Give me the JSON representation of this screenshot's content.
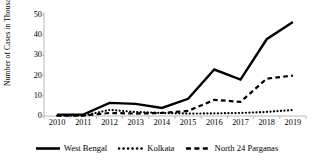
{
  "chart_data": {
    "type": "line",
    "title": "",
    "xlabel": "",
    "ylabel": "Number of Cases in Thousand",
    "categories": [
      "2010",
      "2011",
      "2012",
      "2013",
      "2014",
      "2015",
      "2016",
      "2017",
      "2018",
      "2019"
    ],
    "ylim": [
      0,
      50
    ],
    "yticks": [
      0,
      10,
      20,
      30,
      40,
      50
    ],
    "grid": false,
    "legend_position": "bottom",
    "series": [
      {
        "name": "West Bengal",
        "style": "solid",
        "color": "#000000",
        "values": [
          0.7,
          0.7,
          6.5,
          6.0,
          4.0,
          8.5,
          23.0,
          18.0,
          38.0,
          46.5
        ]
      },
      {
        "name": "Kolkata",
        "style": "dotted",
        "color": "#000000",
        "values": [
          0.2,
          0.2,
          3.0,
          2.0,
          1.5,
          1.2,
          1.3,
          1.5,
          2.0,
          3.0
        ]
      },
      {
        "name": "North 24 Parganas",
        "style": "dashed",
        "color": "#000000",
        "values": [
          0.2,
          0.2,
          1.5,
          1.2,
          1.5,
          2.5,
          8.0,
          7.0,
          18.5,
          20.0
        ]
      }
    ]
  },
  "axis": {
    "y_title": "Number of Cases in Thousand",
    "y_tick_labels": [
      "0",
      "10",
      "20",
      "30",
      "40",
      "50"
    ],
    "x_tick_labels": [
      "2010",
      "2011",
      "2012",
      "2013",
      "2014",
      "2015",
      "2016",
      "2017",
      "2018",
      "2019"
    ]
  },
  "legend": {
    "items": [
      {
        "label": "West Bengal",
        "style": "solid"
      },
      {
        "label": "Kolkata",
        "style": "dotted"
      },
      {
        "label": "North 24 Parganas",
        "style": "dashed"
      }
    ]
  },
  "colors": {
    "series": "#000000",
    "axis": "#a6a6a6",
    "background": "#ffffff"
  }
}
